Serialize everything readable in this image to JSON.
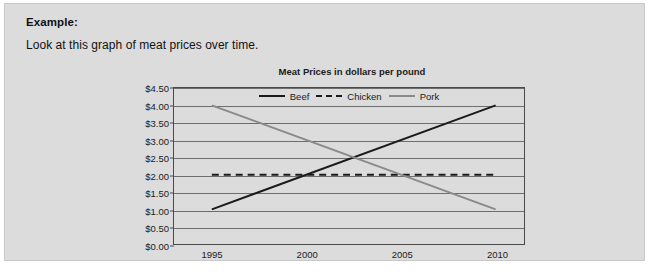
{
  "panel": {
    "heading": "Example:",
    "prompt": "Look at this graph of meat prices over time."
  },
  "chart_data": {
    "type": "line",
    "title": "Meat Prices in dollars per pound",
    "xlabel": "",
    "ylabel": "",
    "x": [
      1995,
      2010
    ],
    "xlim": [
      1993,
      2011.5
    ],
    "ylim": [
      0.0,
      4.5
    ],
    "grid": true,
    "legend_position": "top-center-inside",
    "xticks": [
      "1995",
      "2000",
      "2005",
      "2010"
    ],
    "xtick_values": [
      1995,
      2000,
      2005,
      2010
    ],
    "yticks": [
      "$4.50",
      "$4.00",
      "$3.50",
      "$3.00",
      "$2.50",
      "$2.00",
      "$1.50",
      "$1.00",
      "$0.50",
      "$0.00"
    ],
    "ytick_values": [
      4.5,
      4.0,
      3.5,
      3.0,
      2.5,
      2.0,
      1.5,
      1.0,
      0.5,
      0.0
    ],
    "series": [
      {
        "name": "Beef",
        "style": "solid",
        "color": "#1a1a1a",
        "x": [
          1995,
          2010
        ],
        "values": [
          1.0,
          4.0
        ]
      },
      {
        "name": "Chicken",
        "style": "dashed",
        "color": "#1a1a1a",
        "x": [
          1995,
          2010
        ],
        "values": [
          2.0,
          2.0
        ]
      },
      {
        "name": "Pork",
        "style": "solid",
        "color": "#8a8a8a",
        "x": [
          1995,
          2010
        ],
        "values": [
          4.0,
          1.0
        ]
      }
    ]
  },
  "colors": {
    "panel_background": "#dcdcdc",
    "panel_border": "#c8c8c8",
    "text": "#111111",
    "axis": "#4a4a4a",
    "gridline": "#6e6e6e",
    "beef": "#1a1a1a",
    "chicken": "#1a1a1a",
    "pork": "#8a8a8a"
  }
}
